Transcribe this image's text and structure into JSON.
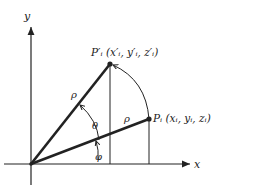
{
  "diagram": {
    "type": "rotation-in-xy-plane",
    "axes": {
      "x_label": "x",
      "y_label": "y"
    },
    "points": {
      "original": {
        "label": "P",
        "sub": "i",
        "coords": "(x",
        "text": "P_i (x_i, y_i, z_i)"
      },
      "rotated": {
        "label": "P",
        "sub": "i",
        "prime": "′",
        "text": "P'_i (x'_i, y'_i, z'_i)"
      }
    },
    "radius_label": "ρ",
    "angles": {
      "theta": "θ",
      "phi": "φ"
    },
    "text": {
      "rotated_point": "P′ᵢ (x′ᵢ, y′ᵢ, z′ᵢ)",
      "original_point": "Pᵢ (xᵢ, yᵢ, zᵢ)",
      "rho": "ρ",
      "theta": "θ",
      "phi": "φ",
      "x": "x",
      "y": "y"
    },
    "colors": {
      "ink": "#222222",
      "background": "#ffffff"
    }
  }
}
